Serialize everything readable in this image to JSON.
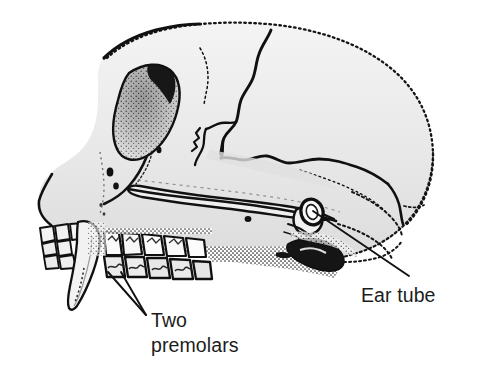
{
  "figure": {
    "kind": "anatomical-line-drawing",
    "background_color": "#ffffff",
    "ink_color": "#111111",
    "bone_fill_color": "#ececec",
    "shadow_fill_color": "#cfcfcf",
    "width": 477,
    "height": 388
  },
  "labels": [
    {
      "id": "ear-tube",
      "text": "Ear tube",
      "x": 361,
      "y": 283,
      "leader": {
        "from_x": 409,
        "from_y": 276,
        "to_x": 313,
        "to_y": 211
      }
    },
    {
      "id": "two-premolars",
      "line1": "Two",
      "line2": "premolars",
      "x": 151,
      "y": 308,
      "leaders": [
        {
          "from_x": 146,
          "from_y": 315,
          "to_x": 108,
          "to_y": 272
        },
        {
          "from_x": 146,
          "from_y": 315,
          "to_x": 121,
          "to_y": 272
        }
      ]
    }
  ],
  "annotations": {
    "ear_tube_label": "Ear tube",
    "two_premolars_label_line1": "Two",
    "two_premolars_label_line2": "premolars"
  }
}
